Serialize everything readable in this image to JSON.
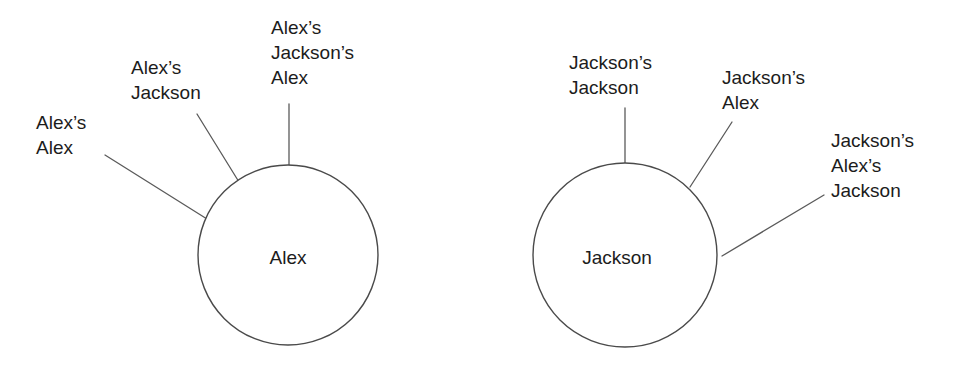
{
  "diagram": {
    "background_color": "#ffffff",
    "line_color": "#5a5a5a",
    "text_color": "#1c1c1c",
    "nodes": [
      {
        "id": "alex",
        "label": "Alex",
        "center_x": 288,
        "center_y": 255,
        "radius": 90,
        "label_x": 288,
        "label_y": 257
      },
      {
        "id": "jackson",
        "label": "Jackson",
        "center_x": 625,
        "center_y": 255,
        "radius": 92,
        "label_x": 617,
        "label_y": 257
      }
    ],
    "branches": [
      {
        "id": "alex-alex",
        "parent": "alex",
        "lines": [
          "Alex’s",
          "Alex"
        ],
        "text_x": 36,
        "text_y": 110,
        "line_x1": 105,
        "line_y1": 155,
        "line_x2": 207,
        "line_y2": 219
      },
      {
        "id": "alex-jackson",
        "parent": "alex",
        "lines": [
          "Alex’s",
          "Jackson"
        ],
        "text_x": 131,
        "text_y": 55,
        "line_x1": 197,
        "line_y1": 114,
        "line_x2": 239,
        "line_y2": 182
      },
      {
        "id": "alex-jacksons-alex",
        "parent": "alex",
        "lines": [
          "Alex’s",
          "Jackson’s",
          "Alex"
        ],
        "text_x": 271,
        "text_y": 15,
        "line_x1": 289,
        "line_y1": 104,
        "line_x2": 289,
        "line_y2": 165
      },
      {
        "id": "jackson-jackson",
        "parent": "jackson",
        "lines": [
          "Jackson’s",
          "Jackson"
        ],
        "text_x": 569,
        "text_y": 50,
        "line_x1": 625,
        "line_y1": 108,
        "line_x2": 625,
        "line_y2": 163
      },
      {
        "id": "jackson-alex",
        "parent": "jackson",
        "lines": [
          "Jackson’s",
          "Alex"
        ],
        "text_x": 722,
        "text_y": 65,
        "line_x1": 732,
        "line_y1": 122,
        "line_x2": 690,
        "line_y2": 187
      },
      {
        "id": "jackson-alexs-jackson",
        "parent": "jackson",
        "lines": [
          "Jackson’s",
          "Alex’s",
          "Jackson"
        ],
        "text_x": 831,
        "text_y": 128,
        "line_x1": 824,
        "line_y1": 195,
        "line_x2": 722,
        "line_y2": 256
      }
    ]
  }
}
